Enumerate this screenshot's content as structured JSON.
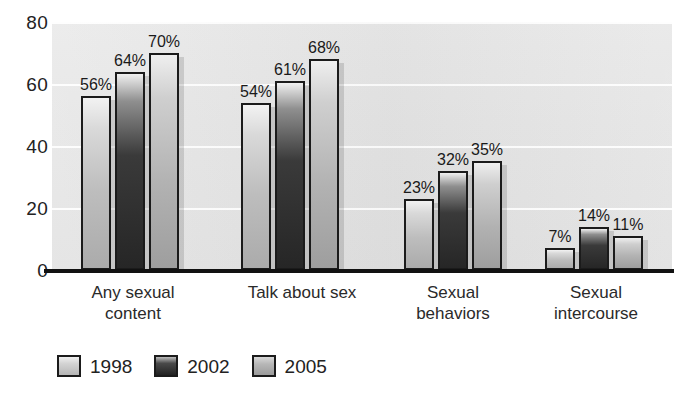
{
  "chart_data": {
    "type": "bar",
    "title": "",
    "subtitle": "",
    "xlabel": "",
    "ylabel": "",
    "ylim": [
      0,
      80
    ],
    "yticks": [
      0,
      20,
      40,
      60,
      80
    ],
    "ytick_labels": [
      "0",
      "20",
      "40",
      "60",
      "80"
    ],
    "grid": true,
    "grid_orientation": "horizontal",
    "legend_position": "bottom-left",
    "categories": [
      "Any sexual content",
      "Talk about sex",
      "Sexual behaviors",
      "Sexual intercourse"
    ],
    "category_lines": [
      [
        "Any sexual",
        "content"
      ],
      [
        "Talk about sex",
        ""
      ],
      [
        "Sexual",
        "behaviors"
      ],
      [
        "Sexual",
        "intercourse"
      ]
    ],
    "series": [
      {
        "name": "1998",
        "color": "#c6c6c6",
        "values": [
          56,
          54,
          23,
          7
        ],
        "value_labels": [
          "56%",
          "54%",
          "23%",
          "7%"
        ]
      },
      {
        "name": "2002",
        "color": "#2b2b2b",
        "values": [
          64,
          61,
          32,
          14
        ],
        "value_labels": [
          "64%",
          "61%",
          "32%",
          "14%"
        ]
      },
      {
        "name": "2005",
        "color": "#a8a8a8",
        "values": [
          70,
          68,
          35,
          11
        ],
        "value_labels": [
          "70%",
          "68%",
          "35%",
          "11%"
        ]
      }
    ],
    "value_suffix": "%"
  },
  "legend": {
    "items": [
      {
        "label": "1998",
        "swatch": "legend-swatch-1998"
      },
      {
        "label": "2002",
        "swatch": "legend-swatch-2002"
      },
      {
        "label": "2005",
        "swatch": "legend-swatch-2005"
      }
    ]
  },
  "colors": {
    "plot_background": "#e4e4e4",
    "axis": "#111111",
    "gridline": "#ffffff",
    "text": "#1a1a1a",
    "bar_1998": "#c6c6c6",
    "bar_2002": "#2b2b2b",
    "bar_2005": "#a8a8a8"
  }
}
